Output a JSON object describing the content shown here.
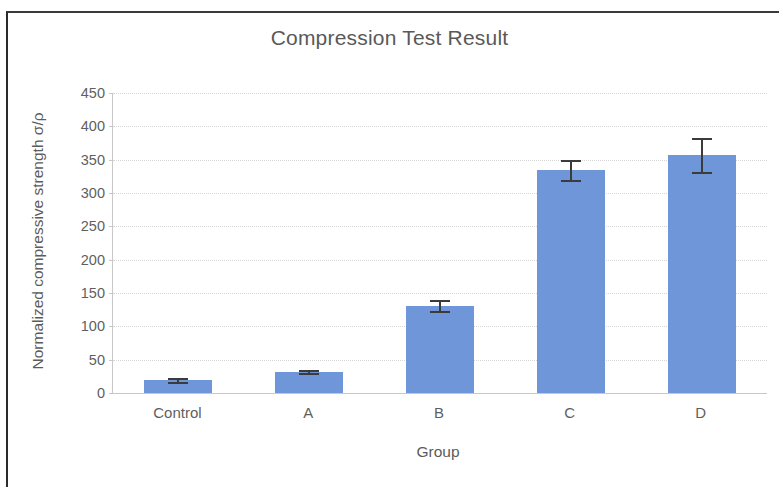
{
  "chart_data": {
    "type": "bar",
    "title": "Compression Test Result",
    "xlabel": "Group",
    "ylabel": "Normalized compressive strength σ/ρ",
    "categories": [
      "Control",
      "A",
      "B",
      "C",
      "D"
    ],
    "values": [
      20,
      32,
      131,
      335,
      357
    ],
    "errors": [
      3,
      2,
      8,
      15,
      25
    ],
    "ylim": [
      0,
      450
    ],
    "ytick_labels": [
      "0",
      "50",
      "100",
      "150",
      "200",
      "250",
      "300",
      "350",
      "400",
      "450"
    ],
    "ytick_values": [
      0,
      50,
      100,
      150,
      200,
      250,
      300,
      350,
      400,
      450
    ],
    "grid": true,
    "legend": "none",
    "series_color": "#6F96D8",
    "error_bar_color": "#3B3B3B",
    "grid_color": "#D6D6D6",
    "axis_color": "#C8C8C8",
    "title_color": "#595959",
    "label_color": "#5F5F5F"
  }
}
